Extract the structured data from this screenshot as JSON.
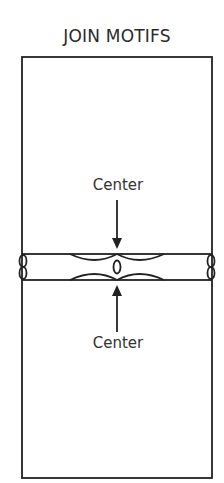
{
  "title": "JOIN MOTIFS",
  "labels": {
    "upper_center": "Center",
    "lower_center": "Center"
  },
  "colors": {
    "line": "#222222",
    "background": "#ffffff"
  }
}
